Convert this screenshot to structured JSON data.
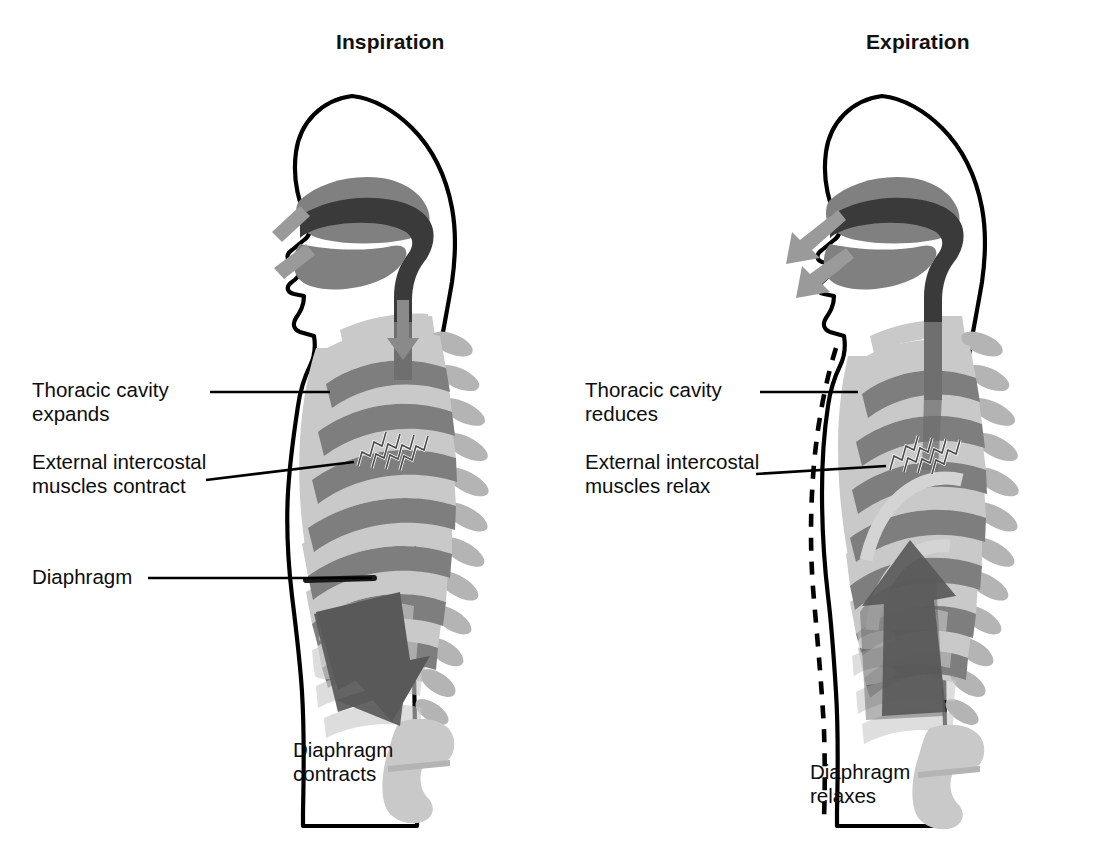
{
  "figure": {
    "kind": "anatomical-diagram",
    "background_color": "#ffffff",
    "ink_color": "#000000"
  },
  "panels": [
    {
      "id": "inspiration",
      "title": "Inspiration",
      "labels": {
        "thoracic": "Thoracic cavity\nexpands",
        "intercostal": "External intercostal\nmuscles  contract",
        "diaphragm": "Diaphragm"
      },
      "caption": "Diaphragm\ncontracts",
      "airflow_direction": "inward",
      "diaphragm_arrow_direction": "down",
      "chest_outline_state": "expanded",
      "ghost_outline_shown": false
    },
    {
      "id": "expiration",
      "title": "Expiration",
      "labels": {
        "thoracic": "Thoracic cavity\nreduces",
        "intercostal": "External intercostal\nmuscles  relax"
      },
      "caption": "Diaphragm\nrelaxes",
      "airflow_direction": "outward",
      "diaphragm_arrow_direction": "up",
      "chest_outline_state": "reduced",
      "ghost_outline_shown": true
    }
  ],
  "icon_names": [
    "airflow-arrow-icon",
    "diaphragm-arrow-icon",
    "intercostal-hatch-icon",
    "dashed-previous-outline-icon"
  ],
  "palette": {
    "bone_light": "#c9c9c9",
    "bone_mid": "#b4b4b4",
    "rib_dark": "#7e7e7e",
    "airway_dark": "#3a3a3a",
    "airway_mid": "#6f6f6f",
    "arrow_dark": "#595959",
    "arrow_mid": "#8a8a8a",
    "outline": "#000000",
    "background": "#ffffff"
  }
}
